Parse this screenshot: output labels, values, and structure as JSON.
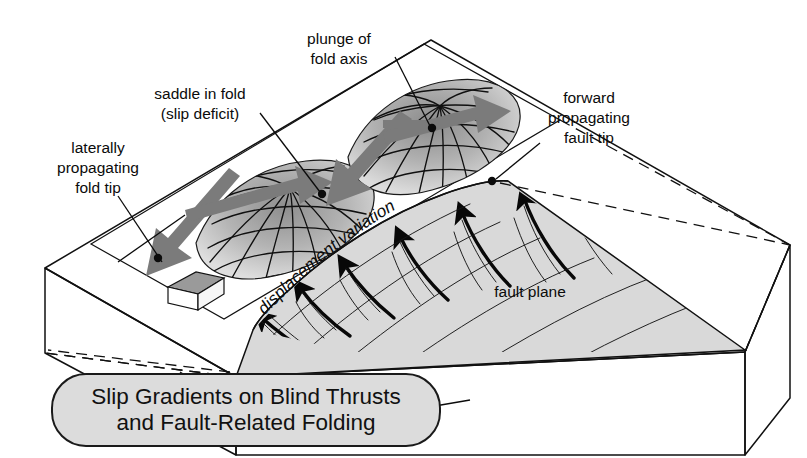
{
  "figure": {
    "kind": "geological-block-diagram",
    "title_box": {
      "line1": "Slip Gradients on Blind Thrusts",
      "line2": "and Fault-Related Folding",
      "fill_color": "#dcdcdc",
      "border_color": "#1a1a1a"
    },
    "annotations": [
      {
        "id": "plunge-of-fold-axis",
        "lines": [
          "plunge of",
          "fold axis"
        ],
        "x": 339,
        "y": 46
      },
      {
        "id": "saddle-in-fold",
        "lines": [
          "saddle in fold",
          "(slip deficit)"
        ],
        "x": 200,
        "y": 101
      },
      {
        "id": "laterally-propagating-fold-tip",
        "lines": [
          "laterally",
          "propagating",
          "fold tip"
        ],
        "x": 98,
        "y": 165
      },
      {
        "id": "forward-propagating-fault-tip",
        "lines": [
          "forward",
          "propagating",
          "fault tip"
        ],
        "x": 589,
        "y": 115
      },
      {
        "id": "fault-plane",
        "lines": [
          "fault plane"
        ],
        "x": 530,
        "y": 293
      }
    ],
    "curved_label": {
      "id": "displacement-variation",
      "text": "displacement variation"
    },
    "scale_object": {
      "id": "house-scale-marker",
      "description": "small building for scale"
    },
    "colors": {
      "top_surface": "#f2f2f2",
      "fold_band": "#e3e3e3",
      "fold_shading": "#9a9a9a",
      "fault_plane": "#d8d8d8",
      "block_side": "#fbfbfb",
      "gray_arrow": "#7b7b7b",
      "ink": "#111111"
    }
  }
}
